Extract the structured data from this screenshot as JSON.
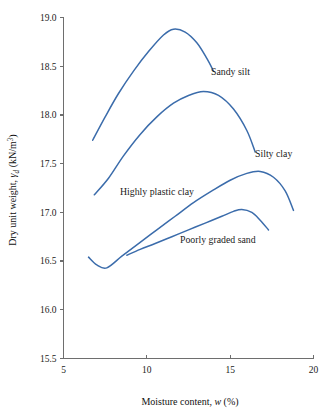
{
  "figure": {
    "background_color": "#ffffff",
    "curve_color": "#3b6cab",
    "axis_color": "#6e6e6e",
    "text_color": "#1a1a1a"
  },
  "axes": {
    "x": {
      "title_prefix": "Moisture content, ",
      "title_symbol": "w",
      "title_suffix": " (%)",
      "ticks": [
        "5",
        "10",
        "15",
        "20"
      ],
      "tick_values": [
        5,
        10,
        15,
        20
      ],
      "range": [
        5,
        20
      ]
    },
    "y": {
      "title_prefix": "Dry unit weight, ",
      "title_symbol": "γ",
      "title_symbol_sub": "d",
      "title_suffix_open": " (kN/m",
      "title_suffix_sup": "3",
      "title_suffix_close": ")",
      "ticks": [
        "15.5",
        "16.0",
        "16.5",
        "17.0",
        "17.5",
        "18.0",
        "18.5",
        "19.0"
      ],
      "tick_values": [
        15.5,
        16.0,
        16.5,
        17.0,
        17.5,
        18.0,
        18.5,
        19.0
      ],
      "range": [
        15.5,
        19.0
      ]
    }
  },
  "labels": {
    "sandy_silt": "Sandy silt",
    "silty_clay": "Silty clay",
    "highly_plastic_clay": "Highly plastic clay",
    "poorly_graded_sand": "Poorly graded sand"
  },
  "chart_data": {
    "type": "line",
    "title": "",
    "xlabel": "Moisture content, w (%)",
    "ylabel": "Dry unit weight, γd (kN/m3)",
    "xlim": [
      5,
      20
    ],
    "ylim": [
      15.5,
      19.0
    ],
    "grid": false,
    "legend": "inline-annotations",
    "annotations": [
      {
        "text": "Sandy silt",
        "x": 13.9,
        "y": 18.46
      },
      {
        "text": "Silty clay",
        "x": 17.1,
        "y": 17.58
      },
      {
        "text": "Highly plastic clay",
        "x": 9.0,
        "y": 17.18
      },
      {
        "text": "Poorly graded sand",
        "x": 12.6,
        "y": 16.74
      }
    ],
    "series": [
      {
        "name": "Sandy silt",
        "color": "#3b6cab",
        "peak": {
          "x": 11.6,
          "y": 18.88
        },
        "x": [
          6.75,
          7.5,
          8.3,
          9.2,
          10.1,
          11.0,
          11.6,
          12.3,
          13.0,
          13.6,
          14.0
        ],
        "y": [
          17.74,
          17.98,
          18.22,
          18.45,
          18.65,
          18.82,
          18.88,
          18.85,
          18.74,
          18.58,
          18.45
        ]
      },
      {
        "name": "Silty clay",
        "color": "#3b6cab",
        "peak": {
          "x": 13.4,
          "y": 18.24
        },
        "x": [
          6.85,
          7.7,
          8.6,
          9.6,
          10.6,
          11.6,
          12.5,
          13.4,
          14.3,
          15.2,
          16.0,
          16.5
        ],
        "y": [
          17.18,
          17.35,
          17.58,
          17.8,
          17.98,
          18.12,
          18.2,
          18.24,
          18.2,
          18.06,
          17.84,
          17.62
        ]
      },
      {
        "name": "Highly plastic clay",
        "color": "#3b6cab",
        "peak": {
          "x": 16.8,
          "y": 17.42
        },
        "x": [
          6.5,
          7.0,
          7.6,
          8.5,
          9.5,
          10.6,
          11.7,
          12.8,
          13.9,
          15.0,
          16.0,
          16.8,
          17.6,
          18.3,
          18.8
        ],
        "y": [
          16.54,
          16.46,
          16.43,
          16.55,
          16.68,
          16.82,
          16.96,
          17.1,
          17.22,
          17.33,
          17.4,
          17.42,
          17.36,
          17.22,
          17.02
        ]
      },
      {
        "name": "Poorly graded sand",
        "color": "#3b6cab",
        "peak": {
          "x": 15.7,
          "y": 17.03
        },
        "x": [
          8.8,
          9.6,
          10.5,
          11.5,
          12.5,
          13.5,
          14.5,
          15.2,
          15.7,
          16.3,
          16.8,
          17.3
        ],
        "y": [
          16.56,
          16.62,
          16.68,
          16.75,
          16.82,
          16.89,
          16.96,
          17.01,
          17.03,
          17.0,
          16.92,
          16.82
        ]
      }
    ]
  }
}
